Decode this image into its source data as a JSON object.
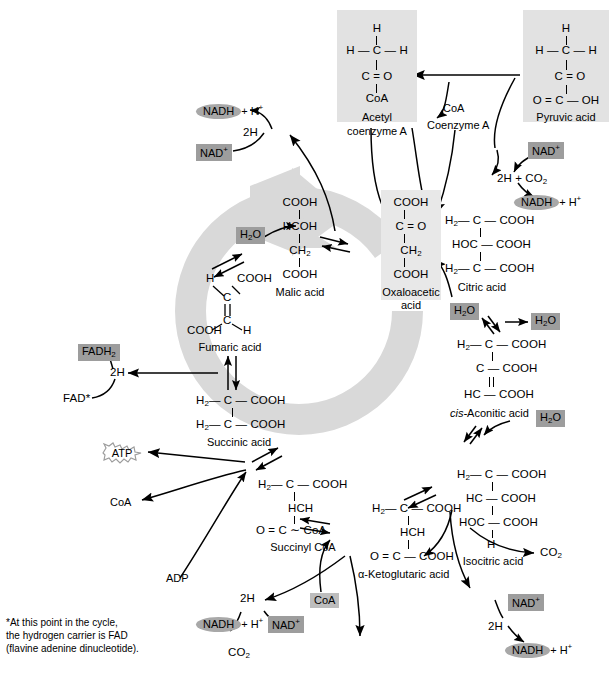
{
  "diagram": {
    "colors": {
      "ring_gray": "#d9d9d9",
      "panel_gray": "#e2e2e2",
      "chip_gray": "#9d9d9d",
      "pill_gray": "#a8a8a8",
      "stroke": "#000000",
      "background": "#ffffff"
    }
  },
  "molecules": {
    "acetyl_coa": {
      "lines": [
        "H",
        "H — C — H",
        "C = O",
        "CoA"
      ],
      "name_line1": "Acetyl",
      "name_line2": "coenzyme A"
    },
    "pyruvic_acid": {
      "lines": [
        "H",
        "H — C — H",
        "C = O",
        "O = C — OH"
      ],
      "name": "Pyruvic acid"
    },
    "oxaloacetic_acid": {
      "lines": [
        "COOH",
        "C = O",
        "CH2",
        "COOH"
      ],
      "name_line1": "Oxaloacetic",
      "name_line2": "acid"
    },
    "citric_acid": {
      "lines": [
        "H2 — C — COOH",
        "HOC — COOH",
        "H2 — C — COOH"
      ],
      "name": "Citric acid"
    },
    "cis_aconitic_acid": {
      "lines": [
        "H2 — C — COOH",
        "C — COOH",
        "HC — COOH"
      ],
      "name_italic": "cis-",
      "name_rest": "Aconitic acid"
    },
    "isocitric_acid": {
      "lines": [
        "H2 — C — COOH",
        "HC — COOH",
        "HOC — COOH",
        "H"
      ],
      "name": "Isocitric acid"
    },
    "alpha_ketoglutaric_acid": {
      "lines": [
        "H2 — C — COOH",
        "HCH",
        "O = C — COOH"
      ],
      "name_symbol": "α",
      "name_rest": "-Ketoglutaric acid"
    },
    "succinyl_coa": {
      "lines": [
        "H2 — C — COOH",
        "HCH",
        "O = C — ~ — CoA"
      ],
      "name": "Succinyl CoA"
    },
    "succinic_acid": {
      "lines": [
        "H2 — C — COOH",
        "H2 — C — COOH"
      ],
      "name": "Succinic acid"
    },
    "fumaric_acid": {
      "top_left": "H",
      "top_right": "COOH",
      "bottom_left": "COOH",
      "bottom_right": "H",
      "carbon_top": "C",
      "carbon_bottom": "C",
      "name": "Fumaric acid"
    },
    "malic_acid": {
      "lines": [
        "COOH",
        "HCOH",
        "CH2",
        "COOH"
      ],
      "name": "Malic acid"
    }
  },
  "cofactors": {
    "coa_top": "CoA",
    "coenzyme_a_top": "Coenzyme A",
    "coa_left": "CoA",
    "coa_bottom": "CoA",
    "adp": "ADP",
    "atp": "ATP",
    "fad": "FAD*",
    "fadh2_label": "FADH",
    "fadh2_sub": "2",
    "nad_plus": "NAD",
    "nad_plus_sup": "+",
    "nadh_label": "NADH",
    "nadh_plus_h": "+ H",
    "nadh_h_sup": "+",
    "water": "H",
    "water_sub": "2",
    "water_rest": "O",
    "two_h": "2H",
    "two_h_plus_co2": "2H + CO",
    "two_h_co2_sub": "2",
    "co2": "CO",
    "co2_sub": "2"
  },
  "labels": {
    "h2o_malic": "H2O",
    "h2o_citric": "H2O",
    "h2o_aconitic_out": "H2O",
    "h2o_isocitric": "H2O"
  },
  "footnote": "*At this point in the cycle,\nthe hydrogen carrier is FAD\n(flavine adenine dinucleotide)."
}
